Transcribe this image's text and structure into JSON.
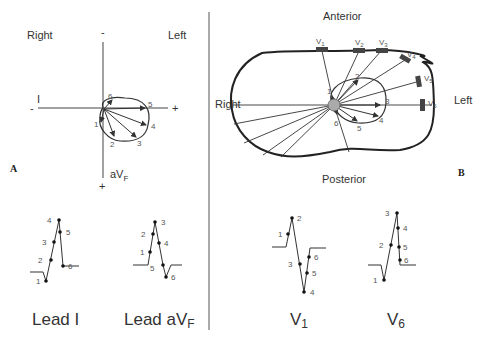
{
  "panel_a": {
    "letter": "A",
    "labels": {
      "right": "Right",
      "left": "Left",
      "minus_top": "-",
      "lead_i": "I",
      "minus_left": "-",
      "plus_right": "+",
      "avf": "aV",
      "avf_sub": "F",
      "plus_bottom": "+"
    },
    "loop_points": [
      "1",
      "2",
      "3",
      "4",
      "5",
      "6"
    ],
    "tracings": [
      {
        "title": "Lead I",
        "points": [
          "1",
          "2",
          "3",
          "4",
          "5",
          "6"
        ]
      },
      {
        "title": "Lead aV",
        "title_sub": "F",
        "points": [
          "1",
          "2",
          "3",
          "4",
          "5",
          "6"
        ]
      }
    ]
  },
  "panel_b": {
    "letter": "B",
    "labels": {
      "anterior": "Anterior",
      "posterior": "Posterior",
      "right": "Right",
      "left": "Left"
    },
    "electrodes": [
      {
        "name": "V",
        "sub": "1"
      },
      {
        "name": "V",
        "sub": "2"
      },
      {
        "name": "V",
        "sub": "3"
      },
      {
        "name": "V",
        "sub": "4"
      },
      {
        "name": "V",
        "sub": "5"
      },
      {
        "name": "V",
        "sub": "6"
      }
    ],
    "loop_points": [
      "1",
      "2",
      "3",
      "4",
      "5",
      "6"
    ],
    "tracings": [
      {
        "title": "V",
        "title_sub": "1",
        "points": [
          "1",
          "2",
          "3",
          "4",
          "5",
          "6"
        ]
      },
      {
        "title": "V",
        "title_sub": "6",
        "points": [
          "1",
          "2",
          "3",
          "4",
          "5",
          "6"
        ]
      }
    ]
  }
}
